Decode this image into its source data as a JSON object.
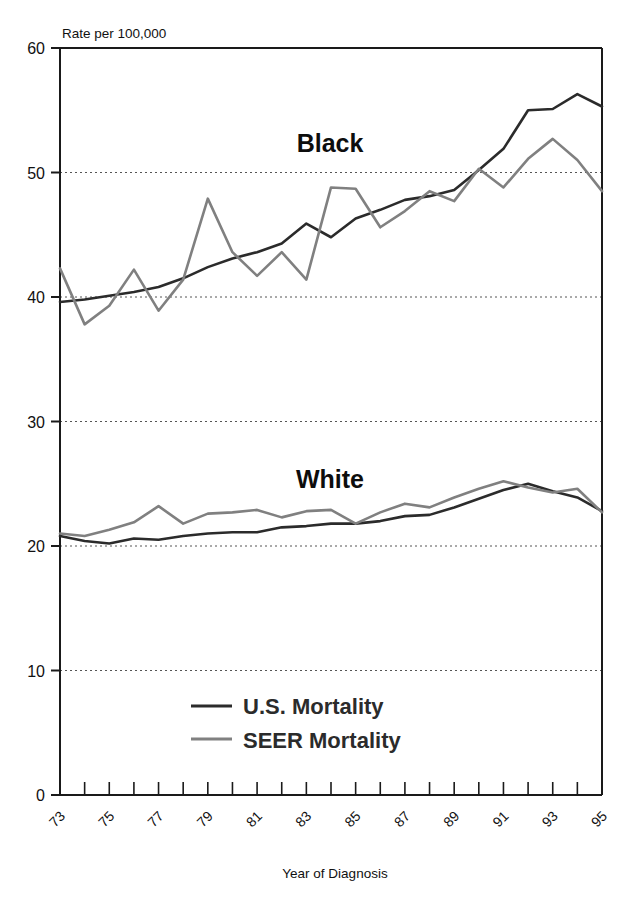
{
  "figure": {
    "y_axis_caption": "Rate per 100,000",
    "x_axis_title": "Year of Diagnosis",
    "annotations": [
      {
        "name": "black-group-label",
        "text": "Black"
      },
      {
        "name": "white-group-label",
        "text": "White"
      }
    ],
    "legend": [
      {
        "name": "us-mortality",
        "label": "U.S. Mortality",
        "color": "#2b2b2b"
      },
      {
        "name": "seer-mortality",
        "label": "SEER Mortality",
        "color": "#808080"
      }
    ]
  },
  "chart_data": {
    "type": "line",
    "title": "",
    "subtitle": "",
    "xlabel": "Year of Diagnosis",
    "ylabel": "Rate per 100,000",
    "ylim": [
      0,
      60
    ],
    "xlim": [
      73,
      95
    ],
    "yticks": [
      0,
      10,
      20,
      30,
      40,
      50,
      60
    ],
    "ytick_labels": [
      "0",
      "10",
      "20",
      "30",
      "40",
      "50",
      "60"
    ],
    "grid": "horizontal-dotted",
    "legend_position": "bottom-center-inside",
    "x": [
      73,
      74,
      75,
      76,
      77,
      78,
      79,
      80,
      81,
      82,
      83,
      84,
      85,
      86,
      87,
      88,
      89,
      90,
      91,
      92,
      93,
      94,
      95
    ],
    "xtick_labels": [
      "73",
      "",
      "75",
      "",
      "77",
      "",
      "79",
      "",
      "81",
      "",
      "83",
      "",
      "85",
      "",
      "87",
      "",
      "89",
      "",
      "91",
      "",
      "93",
      "",
      "95"
    ],
    "xtick_labels_shown": [
      "73",
      "75",
      "77",
      "79",
      "81",
      "83",
      "85",
      "87",
      "89",
      "91",
      "93",
      "95"
    ],
    "series": [
      {
        "name": "Black - U.S. Mortality",
        "group": "Black",
        "source": "U.S. Mortality",
        "color": "#2b2b2b",
        "values": [
          39.6,
          39.8,
          40.1,
          40.4,
          40.8,
          41.5,
          42.4,
          43.1,
          43.6,
          44.3,
          45.9,
          44.8,
          46.3,
          47.0,
          47.8,
          48.1,
          48.6,
          50.2,
          51.9,
          55.0,
          55.1,
          56.3,
          55.3
        ]
      },
      {
        "name": "Black - SEER Mortality",
        "group": "Black",
        "source": "SEER Mortality",
        "color": "#808080",
        "values": [
          42.3,
          37.8,
          39.3,
          42.2,
          38.9,
          41.4,
          47.9,
          43.6,
          41.7,
          43.6,
          41.4,
          48.8,
          48.7,
          45.6,
          46.9,
          48.5,
          47.7,
          50.3,
          48.8,
          51.1,
          52.7,
          51.0,
          48.5
        ]
      },
      {
        "name": "White - U.S. Mortality",
        "group": "White",
        "source": "U.S. Mortality",
        "color": "#2b2b2b",
        "values": [
          20.8,
          20.4,
          20.2,
          20.6,
          20.5,
          20.8,
          21.0,
          21.1,
          21.1,
          21.5,
          21.6,
          21.8,
          21.8,
          22.0,
          22.4,
          22.5,
          23.1,
          23.8,
          24.5,
          25.0,
          24.4,
          23.9,
          22.8
        ]
      },
      {
        "name": "White - SEER Mortality",
        "group": "White",
        "source": "SEER Mortality",
        "color": "#808080",
        "values": [
          21.0,
          20.8,
          21.3,
          21.9,
          23.2,
          21.8,
          22.6,
          22.7,
          22.9,
          22.3,
          22.8,
          22.9,
          21.8,
          22.7,
          23.4,
          23.1,
          23.9,
          24.6,
          25.2,
          24.7,
          24.3,
          24.6,
          22.7
        ]
      }
    ]
  }
}
